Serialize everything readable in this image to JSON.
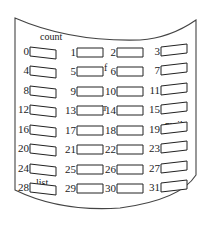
{
  "diagram": {
    "type": "curved-slot-array",
    "columns": 4,
    "rows": 8,
    "slots": [
      {
        "index": "0"
      },
      {
        "index": "1"
      },
      {
        "index": "2"
      },
      {
        "index": "3"
      },
      {
        "index": "4"
      },
      {
        "index": "5"
      },
      {
        "index": "6"
      },
      {
        "index": "7"
      },
      {
        "index": "8"
      },
      {
        "index": "9"
      },
      {
        "index": "10"
      },
      {
        "index": "11"
      },
      {
        "index": "12"
      },
      {
        "index": "13"
      },
      {
        "index": "14"
      },
      {
        "index": "15"
      },
      {
        "index": "16"
      },
      {
        "index": "17"
      },
      {
        "index": "18"
      },
      {
        "index": "19"
      },
      {
        "index": "20"
      },
      {
        "index": "21"
      },
      {
        "index": "22"
      },
      {
        "index": "23"
      },
      {
        "index": "24"
      },
      {
        "index": "25"
      },
      {
        "index": "26"
      },
      {
        "index": "27"
      },
      {
        "index": "28"
      },
      {
        "index": "29"
      },
      {
        "index": "30"
      },
      {
        "index": "31"
      }
    ],
    "labels": {
      "count": "count",
      "f": "f",
      "tr": "tr",
      "mail": "mail",
      "list": "list"
    },
    "colors": {
      "stroke": "#222222",
      "background": "#ffffff"
    }
  }
}
